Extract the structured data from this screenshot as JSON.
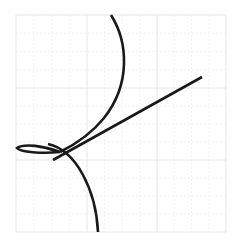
{
  "diagram": {
    "background": "#ffffff",
    "grid": {
      "x0": 16,
      "y0": 15,
      "x1": 226,
      "y1": 232,
      "major_x": [
        16,
        87,
        157,
        226
      ],
      "major_y": [
        15,
        88,
        160,
        232
      ],
      "major_color": "#e6e6e6",
      "minor_color": "#f3f3f3"
    },
    "stroke_color": "#1a1a1a",
    "stroke_width": 2.6,
    "curves": [
      {
        "name": "upper-arc",
        "d": "M111,15 C128,42 131,84 104,118 C92,133 78,143 60,152"
      },
      {
        "name": "tangent-line",
        "d": "M53,160 L202,77"
      },
      {
        "name": "loop",
        "d": "M60,152 C44,146 24,143 17,148 C20,152 42,154 60,152"
      },
      {
        "name": "lower-arc",
        "d": "M48,144 C76,150 96,190 98,232"
      }
    ]
  }
}
